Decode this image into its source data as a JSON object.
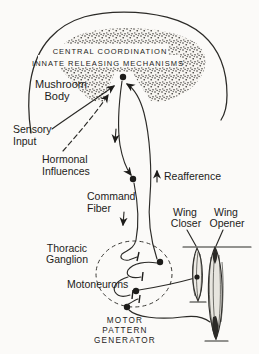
{
  "figure": {
    "colors": {
      "ink": "#1d1c1a",
      "paper": "#fbfaf8",
      "muscle_fill": "#edebe5"
    },
    "brain": {
      "band1": "CENTRAL COORDINATION",
      "band2": "INNATE RELEASING MECHANISMS",
      "mushroom1": "Mushroom",
      "mushroom2": "Body"
    },
    "labels": {
      "sensory1": "Sensory",
      "sensory2": "Input",
      "hormonal1": "Hormonal",
      "hormonal2": "Influences",
      "command1": "Command",
      "command2": "Fiber",
      "reafference": "Reafference",
      "wingcloser1": "Wing",
      "wingcloser2": "Closer",
      "wingopener1": "Wing",
      "wingopener2": "Opener",
      "thoracic1": "Thoracic",
      "thoracic2": "Ganglion",
      "motoneurons": "Motoneurons",
      "mpg1": "MOTOR",
      "mpg2": "PATTERN",
      "mpg3": "GENERATOR"
    }
  }
}
